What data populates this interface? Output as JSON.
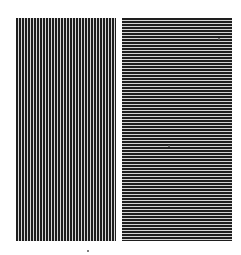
{
  "figure": {
    "panels": [
      {
        "id": "left",
        "orientation": "vertical",
        "stripe_color": "#1e1e1e",
        "gap_color": "#d8d8d8",
        "period_px": 3
      },
      {
        "id": "right",
        "orientation": "horizontal",
        "stripe_color": "#1e1e1e",
        "gap_color": "#d4d4d4",
        "period_px": 3
      }
    ],
    "caption": ""
  },
  "colors": {
    "background": "#ffffff",
    "stripe": "#1e1e1e"
  }
}
